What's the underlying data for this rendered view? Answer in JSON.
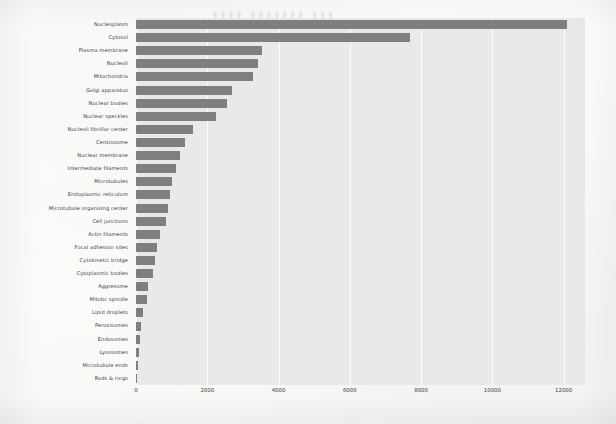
{
  "chart_data": {
    "type": "bar",
    "orientation": "horizontal",
    "title": "",
    "xlabel": "",
    "ylabel": "",
    "xlim": [
      0,
      12600
    ],
    "xticks": [
      0,
      2000,
      4000,
      6000,
      8000,
      10000,
      12000
    ],
    "xtick_labels": [
      "0",
      "2000",
      "4000",
      "6000",
      "8000",
      "10000",
      "12000"
    ],
    "grid": true,
    "legend": "none",
    "bar_color": "#7f7f7f",
    "plot_background": "#e9e9e9",
    "categories": [
      "Nucleoplasm",
      "Cytosol",
      "Plasma membrane",
      "Nucleoli",
      "Mitochondria",
      "Golgi apparatus",
      "Nuclear bodies",
      "Nuclear speckles",
      "Nucleoli fibrillar center",
      "Centrosome",
      "Nuclear membrane",
      "Intermediate filaments",
      "Microtubules",
      "Endoplasmic reticulum",
      "Microtubule organizing center",
      "Cell junctions",
      "Actin filaments",
      "Focal adhesion sites",
      "Cytokinetic bridge",
      "Cytoplasmic bodies",
      "Aggresome",
      "Mitotic spindle",
      "Lipid droplets",
      "Peroxisomes",
      "Endosomes",
      "Lysosomes",
      "Microtubule ends",
      "Rods & rings"
    ],
    "values": [
      12100,
      7700,
      3530,
      3430,
      3270,
      2700,
      2560,
      2250,
      1600,
      1380,
      1240,
      1130,
      1020,
      960,
      900,
      830,
      680,
      590,
      530,
      480,
      340,
      310,
      210,
      135,
      115,
      95,
      60,
      40
    ]
  },
  "artifacts": {
    "bleed_through": [
      "ttt ttttttt tttt",
      "tttttttt ttt tttt",
      "ttttt tttt tt",
      "tttt tttttt",
      "tttt tt"
    ]
  }
}
